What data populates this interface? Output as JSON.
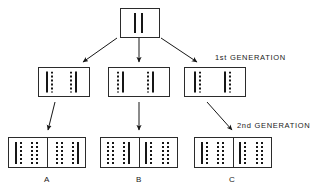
{
  "figure": {
    "background_color": "#ffffff",
    "line_color": "#2b2b2b",
    "bar_color": "#161616"
  },
  "annotations": {
    "generation_1_label": "1st GENERATION",
    "generation_2_label": "2nd GENERATION"
  },
  "parent": {
    "name": "parent-box",
    "bars": [
      {
        "style": "solid"
      },
      {
        "style": "solid"
      }
    ]
  },
  "generation1": [
    {
      "id": "gen1-left",
      "groups": [
        {
          "bars": [
            {
              "style": "solid"
            },
            {
              "style": "dashed"
            }
          ]
        },
        {
          "bars": [
            {
              "style": "dashed"
            },
            {
              "style": "solid"
            }
          ]
        }
      ]
    },
    {
      "id": "gen1-middle",
      "groups": [
        {
          "bars": [
            {
              "style": "dashed"
            },
            {
              "style": "solid"
            }
          ]
        },
        {
          "bars": [
            {
              "style": "dashed"
            },
            {
              "style": "solid"
            }
          ]
        }
      ]
    },
    {
      "id": "gen1-right",
      "groups": [
        {
          "bars": [
            {
              "style": "solid"
            },
            {
              "style": "dashed"
            }
          ]
        },
        {
          "bars": [
            {
              "style": "solid"
            },
            {
              "style": "dashed"
            }
          ]
        }
      ]
    }
  ],
  "generation2": [
    {
      "id": "gen2-a",
      "label": "A",
      "cells": [
        {
          "groups": [
            {
              "bars": [
                {
                  "style": "solid"
                },
                {
                  "style": "dashed"
                }
              ]
            },
            {
              "bars": [
                {
                  "style": "dashed"
                },
                {
                  "style": "dashed"
                }
              ]
            }
          ]
        },
        {
          "groups": [
            {
              "bars": [
                {
                  "style": "dashed"
                },
                {
                  "style": "dashed"
                }
              ]
            },
            {
              "bars": [
                {
                  "style": "dashed"
                },
                {
                  "style": "solid"
                }
              ]
            }
          ]
        }
      ]
    },
    {
      "id": "gen2-b",
      "label": "B",
      "cells": [
        {
          "groups": [
            {
              "bars": [
                {
                  "style": "dashed"
                },
                {
                  "style": "dashed"
                }
              ]
            },
            {
              "bars": [
                {
                  "style": "dashed"
                },
                {
                  "style": "solid"
                }
              ]
            }
          ]
        },
        {
          "groups": [
            {
              "bars": [
                {
                  "style": "solid"
                },
                {
                  "style": "dashed"
                }
              ]
            },
            {
              "bars": [
                {
                  "style": "dashed"
                },
                {
                  "style": "dashed"
                }
              ]
            }
          ]
        }
      ]
    },
    {
      "id": "gen2-c",
      "label": "C",
      "cells": [
        {
          "groups": [
            {
              "bars": [
                {
                  "style": "solid"
                },
                {
                  "style": "dashed"
                }
              ]
            },
            {
              "bars": [
                {
                  "style": "dashed"
                },
                {
                  "style": "dashed"
                }
              ]
            }
          ]
        },
        {
          "groups": [
            {
              "bars": [
                {
                  "style": "solid"
                },
                {
                  "style": "dashed"
                }
              ]
            },
            {
              "bars": [
                {
                  "style": "dashed"
                },
                {
                  "style": "dashed"
                }
              ]
            }
          ]
        }
      ]
    }
  ]
}
